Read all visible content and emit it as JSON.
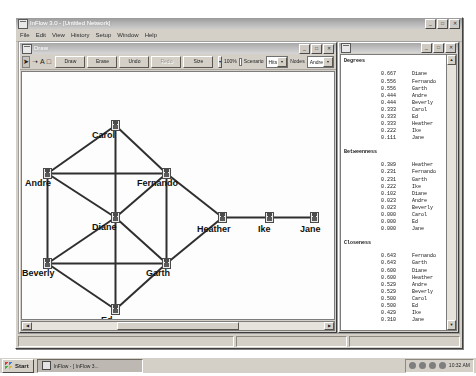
{
  "app": {
    "title": "InFlow 3.0 - [Untitled Network]",
    "menu": [
      "File",
      "Edit",
      "View",
      "History",
      "Setup",
      "Window",
      "Help"
    ],
    "window_buttons": [
      "_",
      "□",
      "✕"
    ]
  },
  "draw_window": {
    "title": "Draw",
    "window_buttons": [
      "_",
      "□",
      "✕"
    ],
    "toolbar": {
      "icons": [
        "pointer-icon",
        "lasso-icon",
        "text-icon",
        "shape-icon"
      ],
      "buttons": [
        "Draw",
        "Erase",
        "Undo",
        "Redo"
      ],
      "size_label": "Size",
      "zoom_value": "100%",
      "scenario_label": "Scenario",
      "scenario_value": "Hits",
      "nodes_label": "Nodes",
      "nodes_value": "Andre"
    }
  },
  "network": {
    "nodes": [
      {
        "id": "carol",
        "label": "Carol",
        "x": 89,
        "y": 48,
        "lx": 70,
        "ly": 58
      },
      {
        "id": "andre",
        "label": "Andre",
        "x": 21,
        "y": 96,
        "lx": 3,
        "ly": 106
      },
      {
        "id": "fernando",
        "label": "Fernando",
        "x": 140,
        "y": 96,
        "lx": 115,
        "ly": 106
      },
      {
        "id": "diane",
        "label": "Diane",
        "x": 89,
        "y": 140,
        "lx": 70,
        "ly": 150
      },
      {
        "id": "beverly",
        "label": "Beverly",
        "x": 21,
        "y": 186,
        "lx": 0,
        "ly": 196
      },
      {
        "id": "garth",
        "label": "Garth",
        "x": 140,
        "y": 186,
        "lx": 124,
        "ly": 196
      },
      {
        "id": "ed",
        "label": "Ed",
        "x": 89,
        "y": 232,
        "lx": 79,
        "ly": 243
      },
      {
        "id": "heather",
        "label": "Heather",
        "x": 196,
        "y": 140,
        "lx": 175,
        "ly": 152
      },
      {
        "id": "ike",
        "label": "Ike",
        "x": 243,
        "y": 140,
        "lx": 236,
        "ly": 152
      },
      {
        "id": "jane",
        "label": "Jane",
        "x": 288,
        "y": 140,
        "lx": 278,
        "ly": 152
      }
    ],
    "edges": [
      [
        "carol",
        "andre"
      ],
      [
        "carol",
        "fernando"
      ],
      [
        "carol",
        "diane"
      ],
      [
        "andre",
        "fernando"
      ],
      [
        "andre",
        "diane"
      ],
      [
        "andre",
        "beverly"
      ],
      [
        "fernando",
        "diane"
      ],
      [
        "fernando",
        "garth"
      ],
      [
        "fernando",
        "heather"
      ],
      [
        "diane",
        "beverly"
      ],
      [
        "diane",
        "garth"
      ],
      [
        "diane",
        "ed"
      ],
      [
        "beverly",
        "garth"
      ],
      [
        "beverly",
        "ed"
      ],
      [
        "garth",
        "ed"
      ],
      [
        "garth",
        "heather"
      ],
      [
        "heather",
        "ike"
      ],
      [
        "ike",
        "jane"
      ]
    ]
  },
  "report": {
    "sections": [
      {
        "title": "Degrees",
        "rows": [
          {
            "value": "0.667",
            "name": "Diane"
          },
          {
            "value": "0.556",
            "name": "Fernando"
          },
          {
            "value": "0.556",
            "name": "Garth"
          },
          {
            "value": "0.444",
            "name": "Andre"
          },
          {
            "value": "0.444",
            "name": "Beverly"
          },
          {
            "value": "0.333",
            "name": "Carol"
          },
          {
            "value": "0.333",
            "name": "Ed"
          },
          {
            "value": "0.333",
            "name": "Heather"
          },
          {
            "value": "0.222",
            "name": "Ike"
          },
          {
            "value": "0.111",
            "name": "Jane"
          }
        ]
      },
      {
        "title": "Betweenness",
        "rows": [
          {
            "value": "0.389",
            "name": "Heather"
          },
          {
            "value": "0.231",
            "name": "Fernando"
          },
          {
            "value": "0.231",
            "name": "Garth"
          },
          {
            "value": "0.222",
            "name": "Ike"
          },
          {
            "value": "0.102",
            "name": "Diane"
          },
          {
            "value": "0.023",
            "name": "Andre"
          },
          {
            "value": "0.023",
            "name": "Beverly"
          },
          {
            "value": "0.000",
            "name": "Carol"
          },
          {
            "value": "0.000",
            "name": "Ed"
          },
          {
            "value": "0.000",
            "name": "Jane"
          }
        ]
      },
      {
        "title": "Closeness",
        "rows": [
          {
            "value": "0.643",
            "name": "Fernando"
          },
          {
            "value": "0.643",
            "name": "Garth"
          },
          {
            "value": "0.600",
            "name": "Diane"
          },
          {
            "value": "0.600",
            "name": "Heather"
          },
          {
            "value": "0.529",
            "name": "Andre"
          },
          {
            "value": "0.529",
            "name": "Beverly"
          },
          {
            "value": "0.500",
            "name": "Carol"
          },
          {
            "value": "0.500",
            "name": "Ed"
          },
          {
            "value": "0.429",
            "name": "Ike"
          },
          {
            "value": "0.310",
            "name": "Jane"
          }
        ]
      }
    ],
    "welcome_lines": [
      "Welcome to InFlow 3.01 (TM)",
      "Copyright (C) 1988-2002, Vald..."
    ],
    "window_buttons": [
      "_",
      "□",
      "✕"
    ],
    "scroll_up": "▲",
    "scroll_down": "▼"
  },
  "statusbar": {
    "cells": [
      "",
      "",
      ""
    ]
  },
  "taskbar": {
    "start_label": "Start",
    "task_label": "InFlow - [ InFlow 3...",
    "clock": "10:32 AM",
    "tray_icons": [
      "tray-icon-1",
      "tray-icon-2",
      "tray-icon-3",
      "tray-icon-4"
    ]
  },
  "colors": {
    "window_face": "#d4d0c8",
    "desktop": "#9e9e9e",
    "canvas": "#fdfdfd",
    "edge": "#2f2f2f"
  }
}
